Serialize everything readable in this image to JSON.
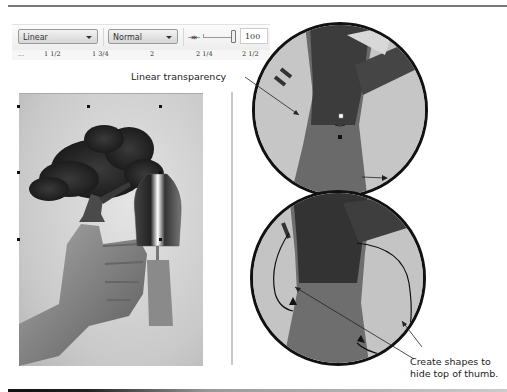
{
  "toolbar": {
    "transparency_type": "Linear",
    "merge_mode": "Normal",
    "slider_icon": "transparency-slider-icon",
    "opacity_value": "100"
  },
  "ruler": {
    "labels": [
      "...",
      "1 1/2",
      "1 3/4",
      "2",
      "2 1/4",
      "2 1/2"
    ]
  },
  "callouts": {
    "top": "Linear transparency",
    "bottom_line1": "Create shapes to",
    "bottom_line2": "hide top of thumb."
  },
  "canvas": {
    "description": "Photo composite: tree growing out of a thumbs-up hand, with a garden trowel",
    "zoom_top": "Zoomed view of tree trunk with linear transparency handles",
    "zoom_bottom": "Zoomed view of shapes drawn to hide top of thumb"
  }
}
